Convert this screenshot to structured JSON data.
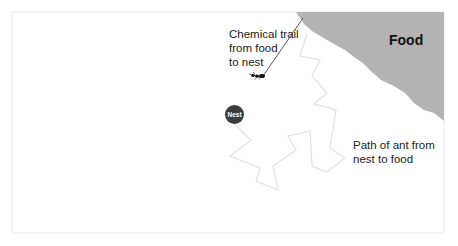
{
  "diagram": {
    "colors": {
      "food_fill": "#b3b3b3",
      "nest_fill": "#3d3d3d",
      "path_stroke": "#e6e6e6",
      "trail_stroke": "#555555",
      "frame_stroke": "#eeeeee"
    },
    "labels": {
      "food": "Food",
      "nest": "Nest",
      "chemical_trail": "Chemical trail\nfrom food\nto nest",
      "ant_path": "Path of ant from\nnest to food"
    },
    "shapes": {
      "frame": {
        "x": 12,
        "y": 12,
        "width": 432,
        "height": 221
      },
      "food_region_points": "296,12 444,12 444,121 434,113 424,110 414,103 405,93 394,86 381,80 372,72 363,63 354,57 345,50 334,44 322,37 312,31 304,24",
      "ant_path_points": "232,122 251,140 230,156 260,168 256,181 278,190 273,166 296,150 288,136 310,131 312,166 327,172 345,158 330,148 336,110 314,104 327,93 312,76 320,60 300,56 307,34",
      "trail_line": {
        "x1": 303,
        "y1": 18,
        "x2": 263,
        "y2": 76
      },
      "ant_position": {
        "x": 257,
        "y": 76
      }
    }
  }
}
